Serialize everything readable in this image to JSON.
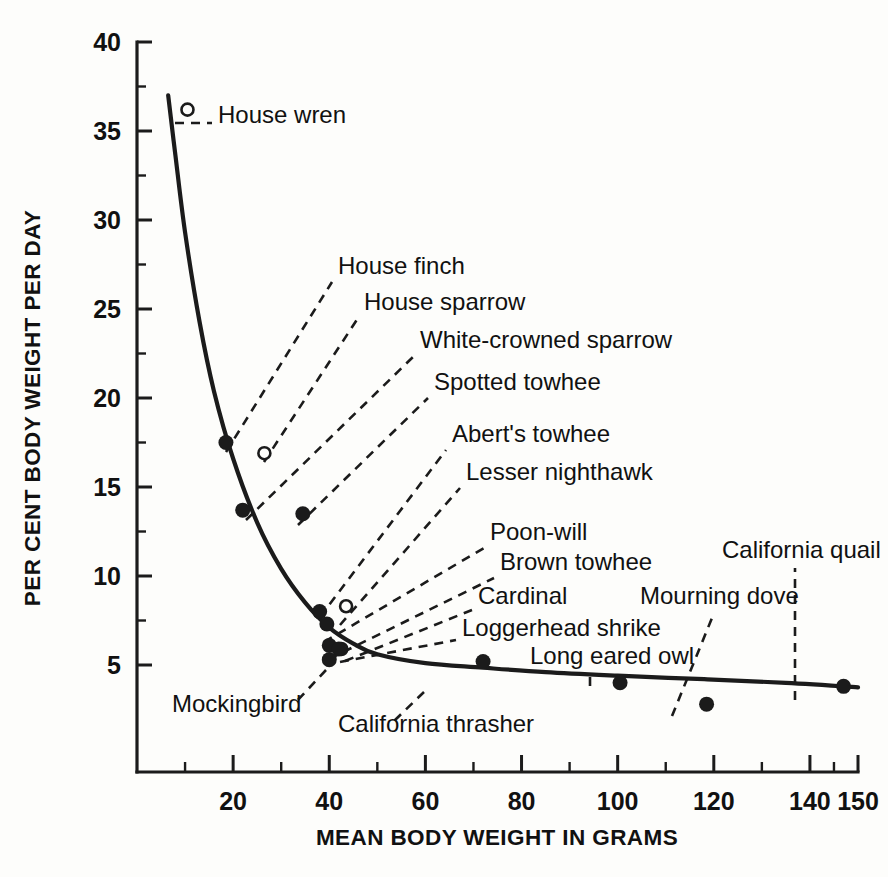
{
  "chart_data": {
    "type": "scatter",
    "title": "",
    "xlabel": "MEAN BODY WEIGHT IN GRAMS",
    "ylabel": "PER CENT BODY WEIGHT PER DAY",
    "xlim": [
      0,
      150
    ],
    "ylim": [
      0,
      40
    ],
    "grid": false,
    "legend": "none",
    "x_ticks_major": [
      20,
      40,
      60,
      80,
      100,
      120,
      140,
      150
    ],
    "x_ticks_minor": [
      10,
      30,
      50,
      70,
      90,
      110,
      130,
      145
    ],
    "y_ticks_major": [
      5,
      10,
      15,
      20,
      25,
      30,
      35,
      40
    ],
    "y_ticks_minor": [
      7.5,
      12.5,
      17.5,
      22.5,
      27.5,
      32.5,
      37.5
    ],
    "x_tick_labels": [
      "20",
      "40",
      "60",
      "80",
      "100",
      "120",
      "140",
      "150"
    ],
    "y_tick_labels": [
      "5",
      "10",
      "15",
      "20",
      "25",
      "30",
      "35",
      "40"
    ],
    "marker_styles": [
      "filled-circle",
      "open-circle"
    ],
    "points": [
      {
        "name": "House wren",
        "x": 10.5,
        "y": 36.2,
        "marker": "open-circle"
      },
      {
        "name": "House finch",
        "x": 18.5,
        "y": 17.5,
        "marker": "filled-circle"
      },
      {
        "name": "House sparrow",
        "x": 26.5,
        "y": 16.9,
        "marker": "open-circle"
      },
      {
        "name": "White-crowned sparrow",
        "x": 22.0,
        "y": 13.7,
        "marker": "filled-circle"
      },
      {
        "name": "Spotted towhee",
        "x": 34.5,
        "y": 13.5,
        "marker": "filled-circle"
      },
      {
        "name": "Abert's towhee",
        "x": 38.0,
        "y": 8.0,
        "marker": "filled-circle"
      },
      {
        "name": "Lesser nighthawk",
        "x": 43.5,
        "y": 8.3,
        "marker": "open-circle"
      },
      {
        "name": "Poon-will",
        "x": 39.5,
        "y": 7.3,
        "marker": "filled-circle"
      },
      {
        "name": "Brown towhee",
        "x": 40.0,
        "y": 6.1,
        "marker": "filled-circle"
      },
      {
        "name": "Cardinal",
        "x": 42.5,
        "y": 5.9,
        "marker": "open-circle"
      },
      {
        "name": "Loggerhead shrike",
        "x": 42.0,
        "y": 5.9,
        "marker": "filled-circle"
      },
      {
        "name": "Mockingbird",
        "x": 40.0,
        "y": 5.3,
        "marker": "filled-circle"
      },
      {
        "name": "California thrasher",
        "x": 72.0,
        "y": 5.2,
        "marker": "filled-circle"
      },
      {
        "name": "Long eared owl",
        "x": 100.5,
        "y": 4.0,
        "marker": "filled-circle"
      },
      {
        "name": "Mourning dove",
        "x": 118.5,
        "y": 2.8,
        "marker": "filled-circle"
      },
      {
        "name": "California quail",
        "x": 147.0,
        "y": 3.8,
        "marker": "filled-circle"
      }
    ],
    "curve": {
      "description": "fitted declining power curve of water turnover vs body weight",
      "x": [
        6.5,
        8,
        10,
        13,
        16,
        20,
        25,
        30,
        35,
        40,
        45,
        50,
        60,
        72,
        85,
        100,
        118,
        135,
        150
      ],
      "y": [
        37.0,
        33.6,
        29.3,
        24.3,
        20.4,
        16.6,
        13.0,
        10.4,
        8.5,
        7.1,
        6.2,
        5.6,
        5.1,
        4.85,
        4.6,
        4.4,
        4.2,
        4.0,
        3.75
      ]
    },
    "labels": [
      {
        "text": "House wren",
        "lx": 218,
        "ly": 123,
        "anchor": "start",
        "leader": [
          [
            175,
            123
          ],
          [
            212,
            123
          ]
        ],
        "dashed": true
      },
      {
        "text": "House finch",
        "lx": 338,
        "ly": 274,
        "anchor": "start",
        "leader": [
          [
            226,
            452
          ],
          [
            332,
            282
          ]
        ],
        "dashed": true
      },
      {
        "text": "House sparrow",
        "lx": 364,
        "ly": 310,
        "anchor": "start",
        "leader": [
          [
            264,
            462
          ],
          [
            358,
            318
          ]
        ],
        "dashed": true
      },
      {
        "text": "White-crowned sparrow",
        "lx": 420,
        "ly": 348,
        "anchor": "start",
        "leader": [
          [
            246,
            520
          ],
          [
            414,
            356
          ]
        ],
        "dashed": true
      },
      {
        "text": "Spotted towhee",
        "lx": 434,
        "ly": 390,
        "anchor": "start",
        "leader": [
          [
            298,
            525
          ],
          [
            428,
            398
          ]
        ],
        "dashed": true
      },
      {
        "text": "Abert's towhee",
        "lx": 452,
        "ly": 442,
        "anchor": "start",
        "leader": [
          [
            320,
            617
          ],
          [
            446,
            450
          ]
        ],
        "dashed": true
      },
      {
        "text": "Lesser nighthawk",
        "lx": 466,
        "ly": 480,
        "anchor": "start",
        "leader": [
          [
            340,
            625
          ],
          [
            460,
            488
          ]
        ],
        "dashed": true
      },
      {
        "text": "Poon-will",
        "lx": 490,
        "ly": 540,
        "anchor": "start",
        "leader": [
          [
            324,
            642
          ],
          [
            484,
            548
          ]
        ],
        "dashed": true
      },
      {
        "text": "Brown towhee",
        "lx": 500,
        "ly": 570,
        "anchor": "start",
        "leader": [
          [
            329,
            659
          ],
          [
            494,
            578
          ]
        ],
        "dashed": true
      },
      {
        "text": "Cardinal",
        "lx": 478,
        "ly": 604,
        "anchor": "start",
        "leader": [
          [
            345,
            661
          ],
          [
            472,
            610
          ]
        ],
        "dashed": true
      },
      {
        "text": "Loggerhead shrike",
        "lx": 462,
        "ly": 636,
        "anchor": "start",
        "leader": [
          [
            340,
            662
          ],
          [
            456,
            640
          ]
        ],
        "dashed": true
      },
      {
        "text": "Long eared owl",
        "lx": 530,
        "ly": 664,
        "anchor": "start",
        "leader": [
          [
            590,
            686
          ],
          [
            590,
            672
          ]
        ],
        "dashed": true
      },
      {
        "text": "Mockingbird",
        "lx": 172,
        "ly": 712,
        "anchor": "start",
        "leader": [
          [
            326,
            670
          ],
          [
            296,
            702
          ]
        ],
        "dashed": true
      },
      {
        "text": "California thrasher",
        "lx": 338,
        "ly": 732,
        "anchor": "start",
        "leader": [
          [
            424,
            692
          ],
          [
            394,
            721
          ]
        ],
        "dashed": true
      },
      {
        "text": "Mourning dove",
        "lx": 640,
        "ly": 604,
        "anchor": "start",
        "leader": [
          [
            672,
            716
          ],
          [
            712,
            618
          ]
        ],
        "dashed": true
      },
      {
        "text": "California quail",
        "lx": 722,
        "ly": 558,
        "anchor": "start",
        "leader": [
          [
            795,
            700
          ],
          [
            795,
            568
          ]
        ],
        "dashed": true
      }
    ]
  }
}
